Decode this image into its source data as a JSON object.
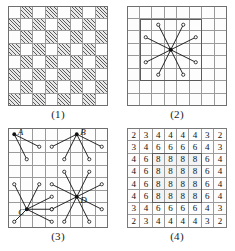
{
  "figure": {
    "grid_size": 8
  },
  "panels": [
    {
      "id": "panel-1",
      "caption": "(1)",
      "type": "checkerboard",
      "rows": 8,
      "cols": 8,
      "pattern": "alternating light and hatched squares",
      "fills": [
        [
          "light",
          "hatch",
          "light",
          "hatch",
          "light",
          "hatch",
          "light",
          "hatch"
        ],
        [
          "hatch",
          "light",
          "hatch",
          "light",
          "hatch",
          "light",
          "hatch",
          "light"
        ],
        [
          "light",
          "hatch",
          "light",
          "hatch",
          "light",
          "hatch",
          "light",
          "hatch"
        ],
        [
          "hatch",
          "light",
          "hatch",
          "light",
          "hatch",
          "light",
          "hatch",
          "light"
        ],
        [
          "light",
          "hatch",
          "light",
          "hatch",
          "light",
          "hatch",
          "light",
          "hatch"
        ],
        [
          "hatch",
          "light",
          "hatch",
          "light",
          "hatch",
          "light",
          "hatch",
          "light"
        ],
        [
          "light",
          "hatch",
          "light",
          "hatch",
          "light",
          "hatch",
          "light",
          "hatch"
        ],
        [
          "hatch",
          "light",
          "hatch",
          "light",
          "hatch",
          "light",
          "hatch",
          "light"
        ]
      ]
    },
    {
      "id": "panel-2",
      "caption": "(2)",
      "type": "knight-moves-center",
      "rows": 8,
      "cols": 8,
      "origin": {
        "col": 3,
        "row": 3
      },
      "move_count": 8,
      "inner_box": {
        "col": 1,
        "row": 1,
        "w": 5,
        "h": 5
      },
      "targets": [
        {
          "col": 4,
          "row": 1
        },
        {
          "col": 5,
          "row": 2
        },
        {
          "col": 5,
          "row": 4
        },
        {
          "col": 4,
          "row": 5
        },
        {
          "col": 2,
          "row": 5
        },
        {
          "col": 1,
          "row": 4
        },
        {
          "col": 1,
          "row": 2
        },
        {
          "col": 2,
          "row": 1
        }
      ]
    },
    {
      "id": "panel-3",
      "caption": "(3)",
      "type": "knight-moves-labelled",
      "rows": 8,
      "cols": 8,
      "points": [
        {
          "label": "A",
          "origin": {
            "col": 0,
            "row": 0
          },
          "move_count": 2,
          "targets": [
            {
              "col": 2,
              "row": 1
            },
            {
              "col": 1,
              "row": 2
            }
          ]
        },
        {
          "label": "B",
          "origin": {
            "col": 5,
            "row": 0
          },
          "move_count": 4,
          "targets": [
            {
              "col": 7,
              "row": 1
            },
            {
              "col": 6,
              "row": 2
            },
            {
              "col": 4,
              "row": 2
            },
            {
              "col": 3,
              "row": 1
            }
          ]
        },
        {
          "label": "C",
          "origin": {
            "col": 1,
            "row": 6
          },
          "move_count": 6,
          "targets": [
            {
              "col": 3,
              "row": 5
            },
            {
              "col": 3,
              "row": 7
            },
            {
              "col": 2,
              "row": 4
            },
            {
              "col": 0,
              "row": 4
            },
            {
              "col": 3,
              "row": 6
            },
            {
              "col": 0,
              "row": 7
            }
          ]
        },
        {
          "label": "D",
          "origin": {
            "col": 5,
            "row": 5
          },
          "move_count": 8,
          "targets": [
            {
              "col": 7,
              "row": 4
            },
            {
              "col": 7,
              "row": 6
            },
            {
              "col": 6,
              "row": 3
            },
            {
              "col": 4,
              "row": 3
            },
            {
              "col": 3,
              "row": 4
            },
            {
              "col": 3,
              "row": 6
            },
            {
              "col": 4,
              "row": 7
            },
            {
              "col": 6,
              "row": 7
            }
          ]
        }
      ]
    },
    {
      "id": "panel-4",
      "caption": "(4)",
      "type": "number-grid",
      "rows": 8,
      "cols": 8,
      "description": "count of knight moves available from each square",
      "values": [
        [
          2,
          3,
          4,
          4,
          4,
          4,
          3,
          2
        ],
        [
          3,
          4,
          6,
          6,
          6,
          6,
          4,
          3
        ],
        [
          4,
          6,
          8,
          8,
          8,
          8,
          6,
          4
        ],
        [
          4,
          6,
          8,
          8,
          8,
          8,
          6,
          4
        ],
        [
          4,
          6,
          8,
          8,
          8,
          8,
          6,
          4
        ],
        [
          4,
          6,
          8,
          8,
          8,
          8,
          6,
          4
        ],
        [
          3,
          4,
          6,
          6,
          6,
          6,
          4,
          3
        ],
        [
          2,
          3,
          4,
          4,
          4,
          4,
          3,
          2
        ]
      ],
      "inner_box": {
        "col": 2,
        "row": 2,
        "w": 4,
        "h": 4
      }
    }
  ],
  "colors": {
    "ink": "#111111",
    "grid_line": "#9a9a9a",
    "frame": "#6f6f6f",
    "hatch": "#5d5d5d",
    "page": "#ffffff"
  }
}
